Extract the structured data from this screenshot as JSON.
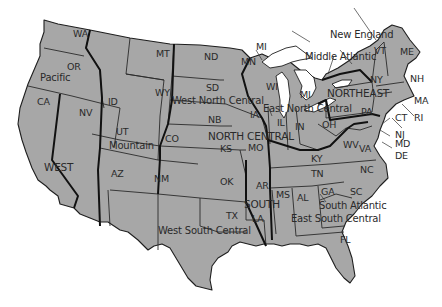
{
  "map": {
    "title": "United States Census Regions and Divisions",
    "colors": {
      "land": "#a7a7a7",
      "border": "#1e1e1e",
      "water": "#ffffff"
    },
    "regions": [
      "WEST",
      "NORTH CENTRAL",
      "NORTHEAST",
      "SOUTH"
    ],
    "divisions": [
      "Pacific",
      "Mountain",
      "West North Central",
      "East North Central",
      "Middle Atlantic",
      "New England",
      "South Atlantic",
      "East South Central",
      "West South Central"
    ],
    "labels": {
      "regions": {
        "west": "WEST",
        "north_central": "NORTH CENTRAL",
        "northeast": "NORTHEAST",
        "south": "SOUTH"
      },
      "divisions": {
        "pacific": "Pacific",
        "mountain": "Mountain",
        "west_north_central": "West North Central",
        "east_north_central": "East North Central",
        "middle_atlantic": "Middle Atlantic",
        "new_england": "New England",
        "south_atlantic": "South Atlantic",
        "east_south_central": "East South Central",
        "west_south_central": "West South Central"
      },
      "states": {
        "WA": "WA",
        "OR": "OR",
        "CA": "CA",
        "NV": "NV",
        "ID": "ID",
        "MT": "MT",
        "WY": "WY",
        "UT": "UT",
        "CO": "CO",
        "AZ": "AZ",
        "NM": "NM",
        "ND": "ND",
        "SD": "SD",
        "NB": "NB",
        "KS": "KS",
        "MN": "MN",
        "IA": "IA",
        "MO": "MO",
        "WI": "WI",
        "MI_UP": "MI",
        "MI": "MI",
        "IL": "IL",
        "IN": "IN",
        "OH": "OH",
        "NY": "NY",
        "PA": "PA",
        "NJ": "NJ",
        "VT": "VT",
        "NH": "NH",
        "ME": "ME",
        "MA": "MA",
        "CT": "CT",
        "RI": "RI",
        "MD": "MD",
        "DE": "DE",
        "WV": "WV",
        "VA": "VA",
        "NC": "NC",
        "SC": "SC",
        "GA": "GA",
        "FL": "FL",
        "KY": "KY",
        "TN": "TN",
        "AL": "AL",
        "MS": "MS",
        "OK": "OK",
        "TX": "TX",
        "AR": "AR",
        "LA": "LA"
      }
    }
  }
}
